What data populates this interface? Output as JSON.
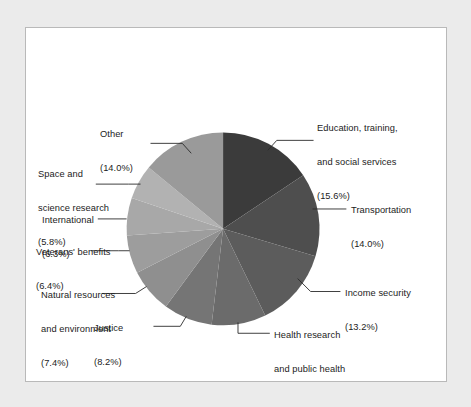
{
  "figure": {
    "background_color": "#ebebeb",
    "plate_color": "#ffffff",
    "border_color": "#b9b9b9"
  },
  "chart_data": {
    "type": "pie",
    "title": "",
    "subtitle": "",
    "xlabel": "",
    "ylabel": "",
    "legend_position": "none",
    "grid": false,
    "start_angle_deg": 0,
    "direction": "clockwise",
    "units": "percent",
    "categories": [
      "Education, training, and social services",
      "Transportation",
      "Income security",
      "Health research and public health",
      "Justice",
      "Natural resources and environment",
      "Veterans' benefits",
      "International",
      "Space and science research",
      "Other"
    ],
    "values": [
      15.6,
      14.0,
      13.2,
      9.1,
      8.2,
      7.4,
      6.4,
      6.3,
      5.8,
      14.0
    ],
    "colors": [
      "#3b3b3b",
      "#4e4e4e",
      "#5c5c5c",
      "#6b6b6b",
      "#757575",
      "#8f8f8f",
      "#9d9d9d",
      "#a8a8a8",
      "#b2b2b2",
      "#9a9a9a"
    ],
    "slices": [
      {
        "label": "Education, training, and social services",
        "value": 15.6,
        "value_text": "(15.6%)",
        "color": "#3b3b3b"
      },
      {
        "label": "Transportation",
        "value": 14.0,
        "value_text": "(14.0%)",
        "color": "#4e4e4e"
      },
      {
        "label": "Income security",
        "value": 13.2,
        "value_text": "(13.2%)",
        "color": "#5c5c5c"
      },
      {
        "label": "Health research and public health",
        "value": 9.1,
        "value_text": "(9.1%)",
        "color": "#6b6b6b"
      },
      {
        "label": "Justice",
        "value": 8.2,
        "value_text": "(8.2%)",
        "color": "#757575"
      },
      {
        "label": "Natural resources and environment",
        "value": 7.4,
        "value_text": "(7.4%)",
        "color": "#8f8f8f"
      },
      {
        "label": "Veterans' benefits",
        "value": 6.4,
        "value_text": "(6.4%)",
        "color": "#9d9d9d"
      },
      {
        "label": "International",
        "value": 6.3,
        "value_text": "(6.3%)",
        "color": "#a8a8a8"
      },
      {
        "label": "Space and science research",
        "value": 5.8,
        "value_text": "(5.8%)",
        "color": "#b2b2b2"
      },
      {
        "label": "Other",
        "value": 14.0,
        "value_text": "(14.0%)",
        "color": "#9a9a9a"
      }
    ]
  },
  "labels": {
    "education": {
      "line1": "Education, training,",
      "line2": "and social services",
      "line3": "(15.6%)"
    },
    "transportation": {
      "line1": "Transportation",
      "line2": "(14.0%)"
    },
    "income_security": {
      "line1": "Income security",
      "line2": "(13.2%)"
    },
    "health_research": {
      "line1": "Health research",
      "line2": "and public health",
      "line3": "(9.1%)"
    },
    "justice": {
      "line1": "Justice",
      "line2": "(8.2%)"
    },
    "natural_resources": {
      "line1": "Natural resources",
      "line2": "and environment",
      "line3": "(7.4%)"
    },
    "veterans": {
      "line1": "Veterans' benefits",
      "line2": "(6.4%)"
    },
    "international": {
      "line1": "International",
      "line2": "(6.3%)"
    },
    "space_science": {
      "line1": "Space and",
      "line2": "science research",
      "line3": "(5.8%)"
    },
    "other": {
      "line1": "Other",
      "line2": "(14.0%)"
    }
  }
}
